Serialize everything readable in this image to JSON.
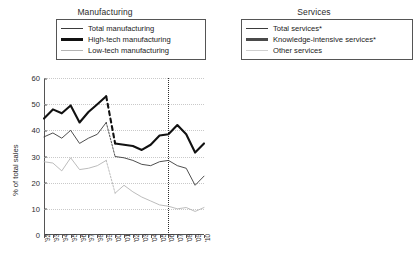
{
  "chart_data": [
    {
      "type": "line",
      "title": "Manufacturing",
      "xlabel": "",
      "ylabel": "% of total sales",
      "ylim": [
        0,
        60
      ],
      "yticks": [
        0,
        10,
        20,
        30,
        40,
        50,
        60
      ],
      "grid": true,
      "legend_position": "top",
      "categories": [
        "'92",
        "'93",
        "'94",
        "'95",
        "'96",
        "'97",
        "'98",
        "'99",
        "'00",
        "'01",
        "'02",
        "'03",
        "'04",
        "'05",
        "'06",
        "'07",
        "'08",
        "'09",
        "'10"
      ],
      "annotations": [
        "dashed segment between '99 and '00 indicates series break",
        "dotted vertical reference line at '06"
      ],
      "series": [
        {
          "name": "Total manufacturing",
          "values": [
            37.5,
            39.0,
            37.0,
            40.0,
            35.0,
            37.0,
            38.5,
            43.0,
            30.0,
            29.5,
            28.5,
            27.0,
            26.5,
            28.0,
            28.5,
            26.5,
            25.5,
            19.0,
            22.5
          ]
        },
        {
          "name": "High-tech manufacturing",
          "values": [
            44.5,
            48.0,
            46.5,
            49.5,
            43.0,
            47.0,
            50.0,
            53.0,
            35.0,
            34.5,
            34.0,
            32.5,
            34.5,
            38.0,
            38.5,
            42.0,
            38.5,
            31.5,
            35.0
          ]
        },
        {
          "name": "Low-tech manufacturing",
          "values": [
            28.0,
            27.5,
            24.5,
            29.5,
            25.0,
            25.5,
            26.5,
            28.5,
            16.0,
            19.0,
            16.5,
            14.5,
            13.0,
            11.5,
            11.0,
            10.0,
            10.5,
            9.0,
            10.5
          ]
        }
      ]
    },
    {
      "type": "line",
      "title": "Services",
      "xlabel": "",
      "ylabel": "% of total sales",
      "ylim": [
        0,
        50
      ],
      "yticks": [
        0,
        10,
        20,
        30,
        40,
        50
      ],
      "grid": true,
      "legend_position": "top",
      "categories": [
        "'97",
        "'98",
        "'99",
        "'00",
        "'01",
        "'02",
        "'03",
        "'04",
        "'05",
        "'06",
        "'07",
        "'08",
        "'09",
        "'10"
      ],
      "annotations": [
        "dashed segment between '99 and '00 indicates series break",
        "dotted vertical reference line at '06",
        "* denotes footnoted series"
      ],
      "series": [
        {
          "name": "Total services*",
          "values": [
            25.5,
            29.0,
            32.5,
            12.0,
            13.0,
            12.0,
            11.0,
            10.5,
            10.0,
            9.5,
            8.0,
            9.0,
            7.0,
            8.5
          ]
        },
        {
          "name": "Knowledge-intensive services*",
          "values": [
            42.5,
            38.5,
            42.0,
            25.0,
            28.0,
            24.5,
            26.0,
            23.0,
            21.0,
            19.5,
            19.0,
            20.0,
            14.0,
            17.0
          ]
        },
        {
          "name": "Other services",
          "values": [
            20.0,
            23.5,
            31.0,
            9.5,
            9.0,
            8.5,
            8.0,
            7.0,
            6.5,
            8.0,
            6.0,
            7.5,
            5.0,
            6.5
          ]
        }
      ]
    }
  ],
  "left_panel": {
    "title": "Manufacturing",
    "ylabel": "% of total sales",
    "legend": [
      {
        "label": "Total manufacturing",
        "style": "thin-dark"
      },
      {
        "label": "High-tech manufacturing",
        "style": "thick-black"
      },
      {
        "label": "Low-tech manufacturing",
        "style": "thin-light"
      }
    ]
  },
  "right_panel": {
    "title": "Services",
    "ylabel": "% of total sales",
    "legend": [
      {
        "label": "Total services*",
        "style": "thin-dark"
      },
      {
        "label": "Knowledge-intensive services*",
        "style": "thick-gray"
      },
      {
        "label": "Other services",
        "style": "thin-light"
      }
    ]
  },
  "colors": {
    "total": "#3b3b3b",
    "high_tech": "#111111",
    "low_tech": "#b4b4b4",
    "knowledge_intensive": "#4a4a4a",
    "other_services": "#cfcfcf",
    "axis": "#555555",
    "grid": "#c9c9c9"
  }
}
